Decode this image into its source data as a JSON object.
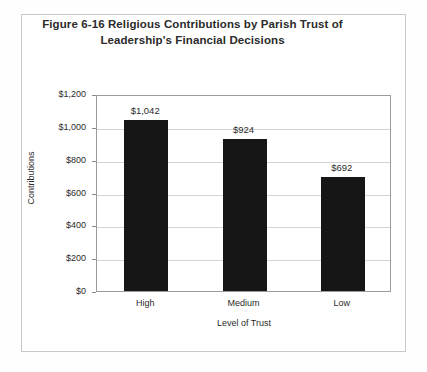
{
  "figure": {
    "title_line_1": "Figure 6-16 Religious Contributions by Parish Trust of",
    "title_line_2": "Leadership's Financial Decisions"
  },
  "chart_data": {
    "type": "bar",
    "title": "Figure 6-16 Religious Contributions by Parish Trust of Leadership's Financial Decisions",
    "categories": [
      "High",
      "Medium",
      "Low"
    ],
    "values": [
      1042,
      924,
      692
    ],
    "value_labels": [
      "$1,042",
      "$924",
      "$692"
    ],
    "xlabel": "Level of Trust",
    "ylabel": "Contributions",
    "ylim": [
      0,
      1200
    ],
    "ytick_values": [
      0,
      200,
      400,
      600,
      800,
      1000,
      1200
    ],
    "ytick_labels": [
      "$0",
      "$200",
      "$400",
      "$600",
      "$800",
      "$1,000",
      "$1,200"
    ],
    "grid": true,
    "legend": false,
    "bar_color": "#161616",
    "plot_border_color": "#9b9b9b",
    "gridline_color": "#d3d3d3"
  }
}
